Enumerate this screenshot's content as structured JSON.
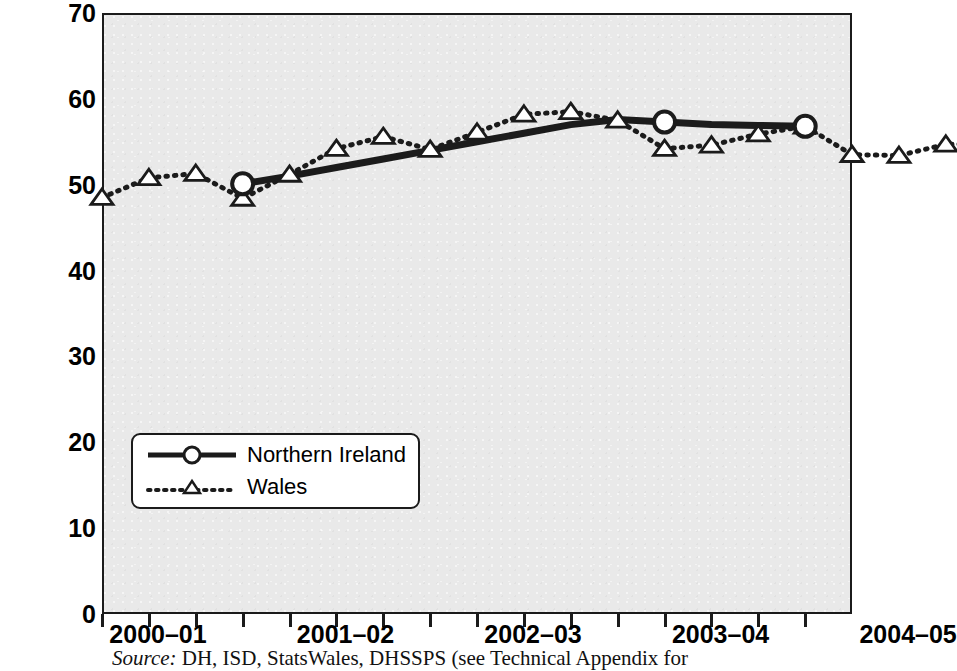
{
  "axes": {
    "y_title": "% patients who had been waiting over 3 months",
    "y_ticks": [
      "0",
      "10",
      "20",
      "30",
      "40",
      "50",
      "60",
      "70"
    ],
    "x_tick_labels": [
      "2000–01",
      "2001–02",
      "2002–03",
      "2003–04",
      "2004–05"
    ]
  },
  "legend": {
    "items": [
      {
        "label": "Northern Ireland",
        "marker": "circle-marker",
        "line": "solid"
      },
      {
        "label": "Wales",
        "marker": "triangle-marker",
        "line": "dotted"
      }
    ]
  },
  "source": {
    "prefix": "Source:",
    "text": "DH, ISD, StatsWales, DHSSPS (see Technical Appendix for"
  },
  "colors": {
    "plot_background": "#e9e9e9",
    "axis": "#1b1b1b",
    "series_line": "#1b1b1b",
    "marker_fill": "#ffffff"
  },
  "chart_data": {
    "type": "line",
    "title": "",
    "xlabel": "",
    "ylabel": "% patients who had been waiting over 3 months",
    "ylim": [
      0,
      70
    ],
    "ytick_step": 10,
    "grid": false,
    "legend_position": "lower-left-inside",
    "x_axis_note": "quarterly points; year labels mark the first quarter of each financial year",
    "x": [
      "2000-01 Q1",
      "2000-01 Q2",
      "2000-01 Q3",
      "2000-01 Q4",
      "2001-02 Q1",
      "2001-02 Q2",
      "2001-02 Q3",
      "2001-02 Q4",
      "2002-03 Q1",
      "2002-03 Q2",
      "2002-03 Q3",
      "2002-03 Q4",
      "2003-04 Q1",
      "2003-04 Q2",
      "2003-04 Q3",
      "2003-04 Q4",
      "2004-05 Q1",
      "2004-05 Q2",
      "2004-05 Q3",
      "2004-05 Q4"
    ],
    "series": [
      {
        "name": "Northern Ireland",
        "marker": "circle",
        "line_style": "solid",
        "x": [
          "2000-01 Q4",
          "2001-02 Q1",
          "2001-02 Q2",
          "2001-02 Q3",
          "2001-02 Q4",
          "2002-03 Q1",
          "2002-03 Q2",
          "2002-03 Q3",
          "2002-03 Q4",
          "2003-04 Q1",
          "2003-04 Q2",
          "2003-04 Q3",
          "2003-04 Q4"
        ],
        "values": [
          50.1,
          51.0,
          52.0,
          53.0,
          54.0,
          55.0,
          56.0,
          57.0,
          57.6,
          57.3,
          57.0,
          56.9,
          56.8
        ],
        "marked_points": [
          {
            "x": "2000-01 Q4",
            "value": 50.1
          },
          {
            "x": "2003-04 Q1",
            "value": 57.3
          },
          {
            "x": "2003-04 Q4",
            "value": 56.8
          }
        ]
      },
      {
        "name": "Wales",
        "marker": "triangle",
        "line_style": "dotted",
        "values": [
          48.5,
          50.8,
          51.3,
          48.4,
          51.2,
          54.2,
          55.6,
          54.1,
          56.1,
          58.2,
          58.5,
          57.5,
          54.2,
          54.6,
          55.9,
          56.8,
          53.5,
          53.4,
          54.7,
          54.8
        ]
      }
    ]
  }
}
